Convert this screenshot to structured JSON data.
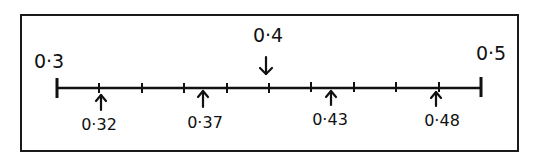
{
  "diagram": {
    "type": "number-line",
    "start": {
      "value": 0.3,
      "label": "0·3"
    },
    "end": {
      "value": 0.5,
      "label": "0·5"
    },
    "tick_interval": 0.02,
    "tick_count": 11,
    "markers_above": [
      {
        "value": 0.4,
        "label": "0·4",
        "direction": "down"
      }
    ],
    "markers_below": [
      {
        "value": 0.32,
        "label": "0·32",
        "direction": "up"
      },
      {
        "value": 0.37,
        "label": "0·37",
        "direction": "up"
      },
      {
        "value": 0.43,
        "label": "0·43",
        "direction": "up"
      },
      {
        "value": 0.48,
        "label": "0·48",
        "direction": "up"
      }
    ],
    "colors": {
      "ink": "#111111",
      "background": "#ffffff"
    }
  }
}
